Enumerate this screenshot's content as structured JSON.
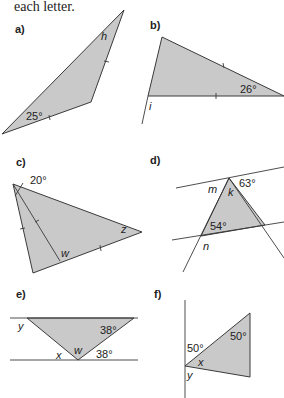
{
  "header": {
    "text": "each letter."
  },
  "panels": [
    {
      "id": "a",
      "label": "a)",
      "angles": [
        "25°"
      ],
      "unknowns": [
        "h"
      ]
    },
    {
      "id": "b",
      "label": "b)",
      "angles": [
        "26°"
      ],
      "unknowns": [
        "i"
      ]
    },
    {
      "id": "c",
      "label": "c)",
      "angles": [
        "20°"
      ],
      "unknowns": [
        "w",
        "z"
      ]
    },
    {
      "id": "d",
      "label": "d)",
      "angles": [
        "63°",
        "54°"
      ],
      "unknowns": [
        "m",
        "k",
        "n"
      ]
    },
    {
      "id": "e",
      "label": "e)",
      "angles": [
        "38°",
        "38°"
      ],
      "unknowns": [
        "y",
        "w",
        "x"
      ]
    },
    {
      "id": "f",
      "label": "f)",
      "angles": [
        "50°",
        "50°"
      ],
      "unknowns": [
        "x",
        "y"
      ]
    }
  ],
  "colors": {
    "fill": "#c9c9c9",
    "stroke": "#3a3a3a",
    "text": "#222222"
  }
}
